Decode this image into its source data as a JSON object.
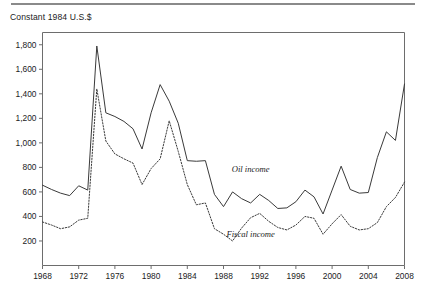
{
  "figure": {
    "axis_title": "Constant 1984 U.S.$",
    "rule_color": "#8a8a8a"
  },
  "chart_data": {
    "type": "line",
    "title": "",
    "subtitle": "",
    "xlabel": "",
    "ylabel": "Constant 1984 U.S.$",
    "xlim": [
      1968,
      2008
    ],
    "ylim": [
      0,
      1900
    ],
    "yticks": [
      200,
      400,
      600,
      800,
      1000,
      1200,
      1400,
      1600,
      1800
    ],
    "ytick_labels": [
      "200",
      "400",
      "600",
      "800",
      "1,000",
      "1,200",
      "1,400",
      "1,600",
      "1,800"
    ],
    "xticks": [
      1968,
      1972,
      1976,
      1980,
      1984,
      1988,
      1992,
      1996,
      2000,
      2004,
      2008
    ],
    "xtick_labels": [
      "1968",
      "1972",
      "1976",
      "1980",
      "1984",
      "1988",
      "1992",
      "1996",
      "2000",
      "2004",
      "2008"
    ],
    "grid": false,
    "legend_position": "inline-annotation",
    "x": [
      1968,
      1969,
      1970,
      1971,
      1972,
      1973,
      1974,
      1975,
      1976,
      1977,
      1978,
      1979,
      1980,
      1981,
      1982,
      1983,
      1984,
      1985,
      1986,
      1987,
      1988,
      1989,
      1990,
      1991,
      1992,
      1993,
      1994,
      1995,
      1996,
      1997,
      1998,
      1999,
      2000,
      2001,
      2002,
      2003,
      2004,
      2005,
      2006,
      2007,
      2008
    ],
    "series": [
      {
        "name": "Oil income",
        "style": "solid",
        "label_x": 1991,
        "label_y": 760,
        "values": [
          655,
          620,
          590,
          570,
          650,
          615,
          1790,
          1245,
          1215,
          1175,
          1115,
          950,
          1245,
          1475,
          1340,
          1160,
          855,
          850,
          855,
          580,
          480,
          600,
          545,
          510,
          580,
          530,
          465,
          470,
          520,
          615,
          560,
          420,
          615,
          810,
          620,
          590,
          595,
          880,
          1090,
          1020,
          1480
        ]
      },
      {
        "name": "Fiscal income",
        "style": "dotted",
        "label_x": 1991,
        "label_y": 230,
        "values": [
          355,
          330,
          300,
          315,
          370,
          385,
          1440,
          1015,
          910,
          870,
          835,
          660,
          790,
          870,
          1180,
          930,
          660,
          495,
          510,
          300,
          255,
          200,
          305,
          390,
          425,
          360,
          310,
          290,
          330,
          400,
          385,
          255,
          340,
          415,
          320,
          290,
          300,
          350,
          480,
          555,
          680
        ]
      }
    ]
  }
}
